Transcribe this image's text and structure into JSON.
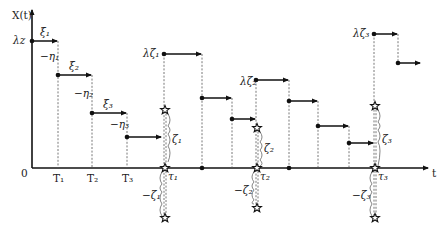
{
  "axes": {
    "y_label": "X(t)",
    "x_label": "t",
    "origin_label": "0"
  },
  "levels": {
    "initial": "λz",
    "jump1": "λζ₁",
    "jump2": "λζ₂",
    "jump3": "λζ₃"
  },
  "step_labels": {
    "xi1": "ξ₁",
    "xi2": "ξ₂",
    "xi3": "ξ₃",
    "eta1": "−η₁",
    "eta2": "−η₂",
    "eta3": "−η₃"
  },
  "time_ticks": {
    "T1": "T₁",
    "T2": "T₂",
    "T3": "T₃",
    "tau1": "τ₁",
    "tau2": "τ₂",
    "tau3": "τ₃"
  },
  "braces": {
    "zeta1": "ζ₁",
    "zeta2": "ζ₂",
    "zeta3": "ζ₃",
    "neg_zeta1": "−ζ₁",
    "neg_zeta2": "−ζ₂",
    "neg_zeta3": "−ζ₃"
  },
  "colors": {
    "line": "#111111",
    "dotted": "#555555"
  }
}
